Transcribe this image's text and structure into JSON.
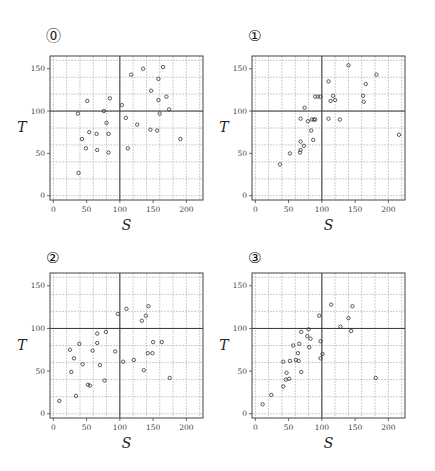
{
  "chart_data": [
    {
      "type": "scatter",
      "label": "⓪",
      "xlabel": "S",
      "ylabel": "T",
      "xlim": [
        -5,
        225
      ],
      "ylim": [
        -5,
        165
      ],
      "xticks": [
        0,
        50,
        100,
        150,
        200
      ],
      "yticks": [
        0,
        50,
        100,
        150
      ],
      "grid": true,
      "grid_step": 20,
      "reference_lines": {
        "x": 100,
        "y": 100
      },
      "x": [
        37,
        51,
        43,
        54,
        49,
        38,
        65,
        66,
        76,
        80,
        85,
        83,
        83,
        103,
        109,
        112,
        117,
        126,
        135,
        146,
        147,
        156,
        158,
        158,
        160,
        165,
        170,
        174,
        191
      ],
      "y": [
        97,
        112,
        67,
        75,
        56,
        27,
        73,
        54,
        100,
        86,
        115,
        73,
        51,
        107,
        92,
        56,
        143,
        84,
        150,
        78,
        124,
        77,
        138,
        113,
        97,
        152,
        117,
        102,
        67
      ]
    },
    {
      "type": "scatter",
      "label": "①",
      "xlabel": "S",
      "ylabel": "T",
      "xlim": [
        -5,
        225
      ],
      "ylim": [
        -5,
        165
      ],
      "xticks": [
        0,
        50,
        100,
        150,
        200
      ],
      "yticks": [
        0,
        50,
        100,
        150
      ],
      "grid": true,
      "grid_step": 20,
      "reference_lines": {
        "x": 100,
        "y": 100
      },
      "x": [
        37,
        52,
        67,
        68,
        68,
        73,
        68,
        74,
        79,
        84,
        85,
        87,
        88,
        90,
        90,
        94,
        98,
        110,
        110,
        113,
        117,
        120,
        127,
        140,
        162,
        163,
        166,
        182,
        216
      ],
      "y": [
        37,
        50,
        51,
        54,
        64,
        59,
        91,
        104,
        88,
        77,
        90,
        66,
        90,
        90,
        117,
        117,
        117,
        135,
        91,
        112,
        118,
        113,
        90,
        154,
        118,
        111,
        132,
        143,
        72
      ]
    },
    {
      "type": "scatter",
      "label": "②",
      "xlabel": "S",
      "ylabel": "T",
      "xlim": [
        -5,
        225
      ],
      "ylim": [
        -5,
        165
      ],
      "xticks": [
        0,
        50,
        100,
        150,
        200
      ],
      "yticks": [
        0,
        50,
        100,
        150
      ],
      "grid": true,
      "grid_step": 20,
      "reference_lines": {
        "x": 100,
        "y": 100
      },
      "x": [
        9,
        34,
        25,
        27,
        31,
        39,
        44,
        52,
        55,
        59,
        66,
        66,
        70,
        77,
        79,
        93,
        97,
        105,
        110,
        121,
        133,
        136,
        139,
        142,
        143,
        149,
        150,
        163,
        175
      ],
      "y": [
        15,
        21,
        75,
        49,
        65,
        82,
        58,
        34,
        33,
        74,
        94,
        83,
        57,
        39,
        96,
        73,
        117,
        61,
        123,
        63,
        109,
        51,
        115,
        71,
        126,
        71,
        84,
        84,
        42
      ]
    },
    {
      "type": "scatter",
      "label": "③",
      "xlabel": "S",
      "ylabel": "T",
      "xlim": [
        -5,
        225
      ],
      "ylim": [
        -5,
        165
      ],
      "xticks": [
        0,
        50,
        100,
        150,
        200
      ],
      "yticks": [
        0,
        50,
        100,
        150
      ],
      "grid": true,
      "grid_step": 20,
      "reference_lines": {
        "x": 100,
        "y": 100
      },
      "x": [
        11,
        24,
        42,
        42,
        46,
        47,
        51,
        52,
        57,
        61,
        64,
        65,
        66,
        69,
        69,
        78,
        80,
        81,
        83,
        96,
        98,
        98,
        101,
        114,
        128,
        140,
        144,
        146,
        181
      ],
      "y": [
        11,
        22,
        32,
        61,
        40,
        48,
        41,
        62,
        80,
        63,
        71,
        62,
        82,
        96,
        49,
        91,
        99,
        78,
        88,
        115,
        85,
        65,
        70,
        128,
        102,
        112,
        97,
        126,
        42
      ]
    }
  ],
  "panels": [
    {
      "label": "⓪",
      "left": 0,
      "top": 0
    },
    {
      "label": "①",
      "left": 218,
      "top": 0
    },
    {
      "label": "②",
      "left": 0,
      "top": 236
    },
    {
      "label": "③",
      "left": 218,
      "top": 236
    }
  ],
  "colors": {
    "frame": "#444444",
    "grid": "#b8b8b8",
    "reference": "#333333",
    "marker": "#333333"
  }
}
